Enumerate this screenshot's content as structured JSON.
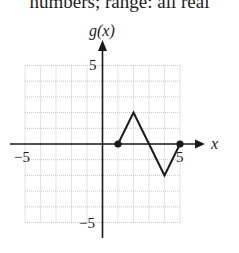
{
  "header_text": "numbers; range: all real",
  "chart_data": {
    "type": "line",
    "title": "",
    "xlabel": "x",
    "ylabel": "g(x)",
    "xlim": [
      -5,
      5
    ],
    "ylim": [
      -5,
      5
    ],
    "grid": true,
    "x_tick_labels": [
      "−5",
      "5"
    ],
    "y_tick_labels": [
      "5",
      "−5"
    ],
    "series": [
      {
        "name": "g(x)",
        "points": [
          [
            1,
            0
          ],
          [
            2,
            2
          ],
          [
            3,
            0
          ],
          [
            4,
            -2
          ],
          [
            5,
            0
          ]
        ],
        "endpoints": [
          [
            1,
            0
          ],
          [
            5,
            0
          ]
        ],
        "endpoint_style": "closed"
      }
    ]
  },
  "labels": {
    "x_axis": "x",
    "y_axis": "g(x)",
    "x_neg": "−5",
    "x_pos": "5",
    "y_pos": "5",
    "y_neg": "−5"
  },
  "colors": {
    "grid": "#b8b8b8",
    "axis": "#1a1a1a",
    "curve": "#1a1a1a"
  }
}
